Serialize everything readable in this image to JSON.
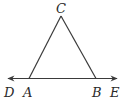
{
  "figure": {
    "type": "triangle-with-line",
    "points": {
      "C": {
        "label": "C"
      },
      "A": {
        "label": "A"
      },
      "B": {
        "label": "B"
      },
      "D": {
        "label": "D"
      },
      "E": {
        "label": "E"
      }
    },
    "segments": [
      "CA",
      "CB"
    ],
    "line": {
      "through": [
        "D",
        "A",
        "B",
        "E"
      ],
      "arrows": "both"
    },
    "stroke_color": "#3a3a3a",
    "label_color": "#2a2a2a"
  }
}
